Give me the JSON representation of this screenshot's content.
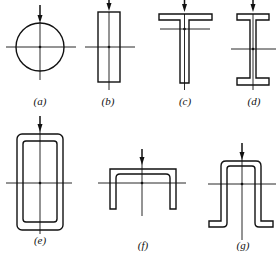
{
  "figure": {
    "colors": {
      "line": "#111111",
      "background": "#ffffff"
    },
    "sections": [
      {
        "id": "a",
        "label": "(a)",
        "shape": "circle"
      },
      {
        "id": "b",
        "label": "(b)",
        "shape": "rectangle"
      },
      {
        "id": "c",
        "label": "(c)",
        "shape": "T-section"
      },
      {
        "id": "d",
        "label": "(d)",
        "shape": "I-section"
      },
      {
        "id": "e",
        "label": "(e)",
        "shape": "hollow-rectangle"
      },
      {
        "id": "f",
        "label": "(f)",
        "shape": "channel-section"
      },
      {
        "id": "g",
        "label": "(g)",
        "shape": "hat-section"
      }
    ]
  }
}
